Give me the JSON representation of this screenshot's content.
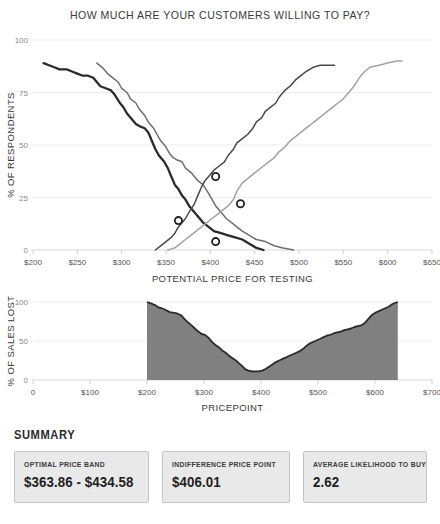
{
  "title": "HOW MUCH ARE YOUR CUSTOMERS WILLING TO PAY?",
  "summary": {
    "heading": "SUMMARY",
    "cards": [
      {
        "label": "OPTIMAL PRICE BAND",
        "value": "$363.86 - $434.58"
      },
      {
        "label": "INDIFFERENCE PRICE POINT",
        "value": "$406.01"
      },
      {
        "label": "AVERAGE LIKELIHOOD TO BUY",
        "value": "2.62"
      }
    ]
  },
  "chart_data": [
    {
      "type": "line",
      "title": "HOW MUCH ARE YOUR CUSTOMERS WILLING TO PAY?",
      "xlabel": "POTENTIAL PRICE FOR TESTING",
      "ylabel": "% OF RESPONDENTS",
      "xlim": [
        200,
        650
      ],
      "ylim": [
        0,
        100
      ],
      "xticks": [
        200,
        250,
        300,
        350,
        400,
        450,
        500,
        550,
        600,
        650
      ],
      "xticklabels": [
        "$200",
        "$250",
        "$300",
        "$350",
        "$400",
        "$450",
        "$500",
        "$550",
        "$600",
        "$650"
      ],
      "yticks": [
        0,
        25,
        50,
        75,
        100
      ],
      "yticklabels": [
        "0",
        "25",
        "50",
        "75",
        "100"
      ],
      "grid": true,
      "legend": "none",
      "series": [
        {
          "name": "too cheap",
          "color": "#2b2b2b",
          "points": [
            [
              212,
              89
            ],
            [
              218,
              88
            ],
            [
              224,
              87
            ],
            [
              230,
              86
            ],
            [
              238,
              86
            ],
            [
              244,
              85
            ],
            [
              250,
              84
            ],
            [
              256,
              83
            ],
            [
              262,
              83
            ],
            [
              268,
              82
            ],
            [
              272,
              80
            ],
            [
              276,
              78
            ],
            [
              282,
              77
            ],
            [
              288,
              76
            ],
            [
              292,
              74
            ],
            [
              298,
              70
            ],
            [
              302,
              68
            ],
            [
              306,
              65
            ],
            [
              312,
              62
            ],
            [
              316,
              60
            ],
            [
              320,
              59
            ],
            [
              326,
              58
            ],
            [
              330,
              56
            ],
            [
              334,
              52
            ],
            [
              338,
              48
            ],
            [
              342,
              45
            ],
            [
              348,
              42
            ],
            [
              352,
              39
            ],
            [
              356,
              35
            ],
            [
              360,
              31
            ],
            [
              364,
              29
            ],
            [
              368,
              26
            ],
            [
              372,
              24
            ],
            [
              376,
              21
            ],
            [
              382,
              18
            ],
            [
              388,
              15
            ],
            [
              392,
              13
            ],
            [
              398,
              11
            ],
            [
              404,
              9
            ],
            [
              412,
              8
            ],
            [
              420,
              7
            ],
            [
              428,
              6
            ],
            [
              436,
              5
            ],
            [
              444,
              3
            ],
            [
              452,
              1
            ],
            [
              460,
              0
            ]
          ]
        },
        {
          "name": "cheap",
          "color": "#6e6e6e",
          "points": [
            [
              272,
              89
            ],
            [
              278,
              87
            ],
            [
              284,
              84
            ],
            [
              290,
              82
            ],
            [
              296,
              80
            ],
            [
              300,
              77
            ],
            [
              306,
              75
            ],
            [
              310,
              72
            ],
            [
              316,
              70
            ],
            [
              320,
              67
            ],
            [
              326,
              64
            ],
            [
              330,
              61
            ],
            [
              336,
              58
            ],
            [
              340,
              55
            ],
            [
              344,
              52
            ],
            [
              350,
              49
            ],
            [
              354,
              46
            ],
            [
              358,
              44
            ],
            [
              362,
              43
            ],
            [
              368,
              42
            ],
            [
              372,
              39
            ],
            [
              378,
              37
            ],
            [
              382,
              35
            ],
            [
              386,
              33
            ],
            [
              392,
              31
            ],
            [
              398,
              27
            ],
            [
              402,
              24
            ],
            [
              406,
              21
            ],
            [
              412,
              18
            ],
            [
              418,
              15
            ],
            [
              424,
              13
            ],
            [
              430,
              11
            ],
            [
              436,
              9
            ],
            [
              444,
              7
            ],
            [
              452,
              5
            ],
            [
              462,
              4
            ],
            [
              472,
              2
            ],
            [
              482,
              1
            ],
            [
              494,
              0
            ]
          ]
        },
        {
          "name": "expensive",
          "color": "#4a4a4a",
          "points": [
            [
              338,
              0
            ],
            [
              344,
              2
            ],
            [
              350,
              4
            ],
            [
              356,
              6
            ],
            [
              360,
              8
            ],
            [
              364,
              11
            ],
            [
              368,
              13
            ],
            [
              372,
              15
            ],
            [
              376,
              18
            ],
            [
              382,
              22
            ],
            [
              386,
              26
            ],
            [
              390,
              30
            ],
            [
              394,
              33
            ],
            [
              398,
              35
            ],
            [
              404,
              38
            ],
            [
              410,
              40
            ],
            [
              416,
              42
            ],
            [
              420,
              45
            ],
            [
              426,
              48
            ],
            [
              430,
              51
            ],
            [
              436,
              53
            ],
            [
              442,
              55
            ],
            [
              448,
              58
            ],
            [
              452,
              61
            ],
            [
              458,
              63
            ],
            [
              462,
              66
            ],
            [
              468,
              68
            ],
            [
              474,
              70
            ],
            [
              478,
              73
            ],
            [
              484,
              76
            ],
            [
              490,
              78
            ],
            [
              496,
              81
            ],
            [
              502,
              83
            ],
            [
              508,
              85
            ],
            [
              516,
              87
            ],
            [
              524,
              88
            ],
            [
              532,
              88
            ],
            [
              540,
              88
            ]
          ]
        },
        {
          "name": "too expensive",
          "color": "#a2a2a2",
          "points": [
            [
              352,
              0
            ],
            [
              360,
              1
            ],
            [
              366,
              3
            ],
            [
              372,
              5
            ],
            [
              378,
              7
            ],
            [
              384,
              9
            ],
            [
              390,
              11
            ],
            [
              396,
              13
            ],
            [
              402,
              15
            ],
            [
              408,
              17
            ],
            [
              414,
              19
            ],
            [
              420,
              21
            ],
            [
              426,
              24
            ],
            [
              430,
              28
            ],
            [
              436,
              32
            ],
            [
              442,
              34
            ],
            [
              448,
              36
            ],
            [
              454,
              38
            ],
            [
              460,
              40
            ],
            [
              466,
              42
            ],
            [
              472,
              44
            ],
            [
              478,
              47
            ],
            [
              484,
              49
            ],
            [
              490,
              52
            ],
            [
              496,
              54
            ],
            [
              502,
              56
            ],
            [
              508,
              58
            ],
            [
              514,
              60
            ],
            [
              520,
              62
            ],
            [
              526,
              64
            ],
            [
              532,
              66
            ],
            [
              538,
              68
            ],
            [
              544,
              70
            ],
            [
              550,
              72
            ],
            [
              556,
              75
            ],
            [
              562,
              78
            ],
            [
              568,
              82
            ],
            [
              574,
              85
            ],
            [
              580,
              87
            ],
            [
              590,
              88
            ],
            [
              600,
              89
            ],
            [
              610,
              90
            ],
            [
              616,
              90
            ]
          ]
        }
      ],
      "intersections": [
        {
          "name": "indifference-point",
          "x": 406,
          "y": 35
        },
        {
          "name": "upper-bound-point",
          "x": 434,
          "y": 22
        },
        {
          "name": "lower-bound-point",
          "x": 364,
          "y": 14
        },
        {
          "name": "optimal-price-point",
          "x": 406,
          "y": 4
        }
      ]
    },
    {
      "type": "area",
      "title": "",
      "xlabel": "PRICEPOINT",
      "ylabel": "% OF SALES LOST",
      "xlim": [
        0,
        700
      ],
      "ylim": [
        0,
        100
      ],
      "xticks": [
        0,
        100,
        200,
        300,
        400,
        500,
        600,
        700
      ],
      "xticklabels": [
        "0",
        "$100",
        "$200",
        "$300",
        "$400",
        "$500",
        "$600",
        "$700"
      ],
      "yticks": [
        0,
        50,
        100
      ],
      "yticklabels": [
        "0",
        "50",
        "100"
      ],
      "grid": true,
      "legend": "none",
      "fill_color": "#808080",
      "line_color": "#2b2b2b",
      "points": [
        [
          200,
          100
        ],
        [
          208,
          98
        ],
        [
          214,
          96
        ],
        [
          220,
          93
        ],
        [
          226,
          92
        ],
        [
          232,
          90
        ],
        [
          240,
          87
        ],
        [
          248,
          86
        ],
        [
          254,
          85
        ],
        [
          260,
          83
        ],
        [
          266,
          78
        ],
        [
          272,
          74
        ],
        [
          278,
          70
        ],
        [
          284,
          66
        ],
        [
          290,
          62
        ],
        [
          296,
          59
        ],
        [
          302,
          58
        ],
        [
          308,
          54
        ],
        [
          314,
          49
        ],
        [
          320,
          45
        ],
        [
          326,
          42
        ],
        [
          332,
          38
        ],
        [
          338,
          35
        ],
        [
          344,
          31
        ],
        [
          350,
          28
        ],
        [
          356,
          25
        ],
        [
          362,
          21
        ],
        [
          368,
          17
        ],
        [
          372,
          14
        ],
        [
          378,
          12
        ],
        [
          384,
          11
        ],
        [
          390,
          11
        ],
        [
          396,
          11
        ],
        [
          402,
          12
        ],
        [
          408,
          14
        ],
        [
          414,
          17
        ],
        [
          420,
          20
        ],
        [
          426,
          23
        ],
        [
          432,
          25
        ],
        [
          438,
          27
        ],
        [
          444,
          29
        ],
        [
          450,
          31
        ],
        [
          456,
          33
        ],
        [
          462,
          35
        ],
        [
          468,
          37
        ],
        [
          474,
          40
        ],
        [
          480,
          44
        ],
        [
          486,
          47
        ],
        [
          492,
          49
        ],
        [
          498,
          51
        ],
        [
          504,
          53
        ],
        [
          510,
          55
        ],
        [
          516,
          57
        ],
        [
          522,
          58
        ],
        [
          528,
          60
        ],
        [
          534,
          61
        ],
        [
          540,
          62
        ],
        [
          546,
          64
        ],
        [
          552,
          65
        ],
        [
          558,
          66
        ],
        [
          564,
          68
        ],
        [
          570,
          69
        ],
        [
          576,
          70
        ],
        [
          582,
          73
        ],
        [
          588,
          78
        ],
        [
          594,
          83
        ],
        [
          600,
          86
        ],
        [
          606,
          88
        ],
        [
          612,
          90
        ],
        [
          618,
          92
        ],
        [
          624,
          94
        ],
        [
          630,
          97
        ],
        [
          636,
          99
        ],
        [
          640,
          100
        ]
      ]
    }
  ]
}
